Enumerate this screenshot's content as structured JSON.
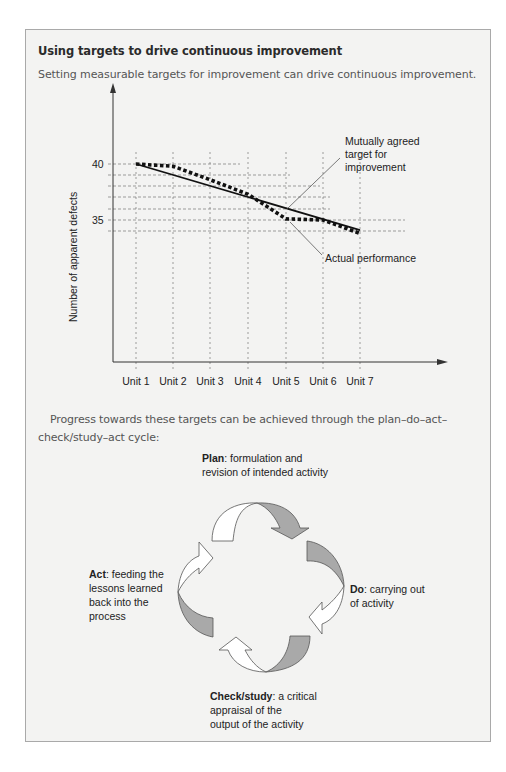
{
  "box": {
    "title": "Using targets to drive continuous improvement",
    "subtitle": "Setting measurable targets for improvement can drive continuous improvement.",
    "paragraph": "Progress towards these targets can be achieved through the plan–do–act–check/study–act cycle:"
  },
  "chart_data": {
    "type": "line",
    "title": "",
    "xlabel": "",
    "ylabel": "Number of apparent defects",
    "categories": [
      "Unit 1",
      "Unit 2",
      "Unit 3",
      "Unit 4",
      "Unit 5",
      "Unit 6",
      "Unit 7"
    ],
    "y_ticks": [
      40,
      35
    ],
    "grid": "dashed",
    "series": [
      {
        "name": "Mutually agreed target for improvement",
        "style": "solid",
        "values": [
          40.0,
          39.0,
          38.0,
          37.1,
          36.1,
          35.1,
          34.1
        ]
      },
      {
        "name": "Actual performance",
        "style": "dotted",
        "values": [
          40.0,
          39.8,
          38.6,
          37.3,
          35.1,
          35.0,
          33.8
        ]
      }
    ],
    "annotations": [
      {
        "text": "Mutually agreed target for improvement",
        "points_to": "target line near Unit 5"
      },
      {
        "text": "Actual performance",
        "points_to": "actual line near Unit 5"
      }
    ]
  },
  "cycle": {
    "plan": {
      "label": "Plan",
      "text": ": formulation and",
      "text2": "revision of intended activity"
    },
    "do": {
      "label": "Do",
      "text": ": carrying out",
      "text2": "of activity"
    },
    "check": {
      "label": "Check/study",
      "text": ": a critical",
      "text2": "appraisal of the",
      "text3": "output of the activity"
    },
    "act": {
      "label": "Act",
      "text": ": feeding the",
      "text2": "lessons learned",
      "text3": "back into the",
      "text4": "process"
    },
    "colors": {
      "filled": "#a9a9a9",
      "outline": "#555555",
      "open": "#ffffff"
    }
  }
}
